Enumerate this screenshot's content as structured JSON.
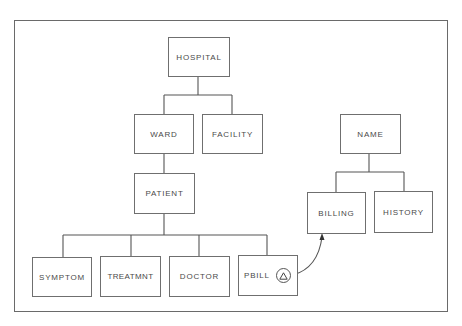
{
  "diagram": {
    "type": "hierarchical-database-tree",
    "nodes": {
      "hospital": {
        "label": "HOSPITAL"
      },
      "ward": {
        "label": "WARD"
      },
      "facility": {
        "label": "FACILITY"
      },
      "patient": {
        "label": "PATIENT"
      },
      "symptom": {
        "label": "SYMPTOM"
      },
      "treatmnt": {
        "label": "TREATMNT"
      },
      "doctor": {
        "label": "DOCTOR"
      },
      "pbill": {
        "label": "PBILL",
        "pointer_icon": "triangle-in-circle"
      },
      "name": {
        "label": "NAME"
      },
      "billing": {
        "label": "BILLING"
      },
      "history": {
        "label": "HISTORY"
      }
    },
    "edges": [
      [
        "HOSPITAL",
        "WARD"
      ],
      [
        "HOSPITAL",
        "FACILITY"
      ],
      [
        "WARD",
        "PATIENT"
      ],
      [
        "PATIENT",
        "SYMPTOM"
      ],
      [
        "PATIENT",
        "TREATMNT"
      ],
      [
        "PATIENT",
        "DOCTOR"
      ],
      [
        "PATIENT",
        "PBILL"
      ],
      [
        "NAME",
        "BILLING"
      ],
      [
        "NAME",
        "HISTORY"
      ]
    ],
    "pointers": [
      {
        "from": "PBILL",
        "to": "BILLING",
        "style": "curved-arrow"
      }
    ],
    "colors": {
      "line": "#555555",
      "text": "#4a4a4a",
      "background": "#ffffff"
    }
  }
}
